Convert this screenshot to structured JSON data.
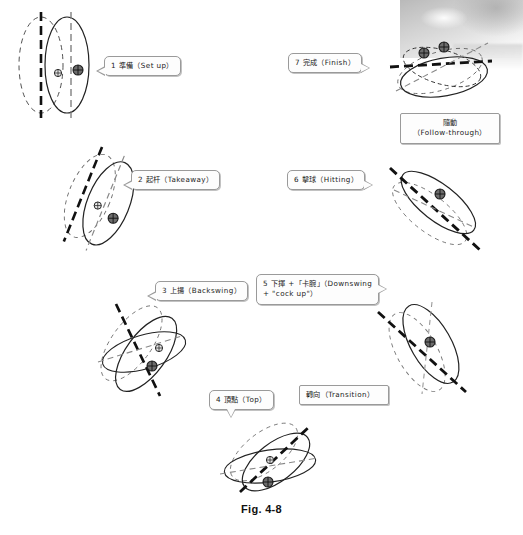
{
  "figure": {
    "caption": "Fig. 4-8"
  },
  "callouts": [
    {
      "id": "set-up",
      "line1": "1 準備（Set up）",
      "line2": ""
    },
    {
      "id": "takeaway",
      "line1": "2 起杆（Takeaway）",
      "line2": ""
    },
    {
      "id": "backswing",
      "line1": "3 上揚（Backswing）",
      "line2": ""
    },
    {
      "id": "top",
      "line1": "4 頂點（Top）",
      "line2": ""
    },
    {
      "id": "transition",
      "line1": "轉向（Transition）",
      "line2": ""
    },
    {
      "id": "downswing",
      "line1": "5 下揮 +「卡腕」（Downswing",
      "line2": "+ \"cock up\"）"
    },
    {
      "id": "hitting",
      "line1": "6 擊球（Hitting）",
      "line2": ""
    },
    {
      "id": "follow-through",
      "line1": "隨動",
      "line2": "（Follow-through）"
    },
    {
      "id": "finish",
      "line1": "7 完成（Finish）",
      "line2": ""
    }
  ],
  "poses": [
    {
      "id": "pose-set-up",
      "phase": "1 準備（Set up）",
      "cx": 58,
      "cy": 65,
      "rotation": 0
    },
    {
      "id": "pose-takeaway",
      "phase": "2 起杆（Takeaway）",
      "cx": 100,
      "cy": 200,
      "rotation": 22
    },
    {
      "id": "pose-backswing",
      "phase": "3 上揚（Backswing）",
      "cx": 138,
      "cy": 348,
      "rotation": 38
    },
    {
      "id": "pose-top",
      "phase": "4 頂點（Top）",
      "cx": 268,
      "cy": 460,
      "rotation": 58
    },
    {
      "id": "pose-downswing",
      "phase": "5 下揮（Downswing）",
      "cx": 424,
      "cy": 348,
      "rotation": -40
    },
    {
      "id": "pose-hitting",
      "phase": "6 擊球（Hitting）",
      "cx": 434,
      "cy": 208,
      "rotation": -58
    },
    {
      "id": "pose-finish",
      "phase": "7 完成（Finish）",
      "cx": 440,
      "cy": 65,
      "rotation": -82
    }
  ],
  "colors": {
    "ink": "#111111",
    "stroke": "#2b2b2b",
    "bubble_border": "#9a9a9a",
    "bubble_fill": "#fdfdfd",
    "page": "#ffffff"
  }
}
